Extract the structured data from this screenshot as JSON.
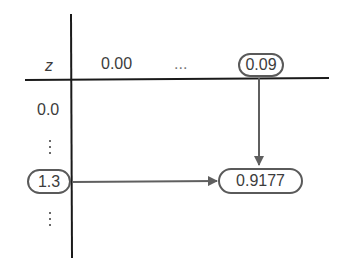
{
  "diagram": {
    "colors": {
      "axis": "#1a1a1a",
      "arrow": "#5f5f5f",
      "pill_border": "#5a5a5a",
      "text": "#3c3c3c"
    },
    "header": {
      "row_label": "z",
      "columns": [
        "0.00",
        "...",
        "0.09"
      ],
      "highlighted_column": "0.09"
    },
    "rows": {
      "first": "0.0",
      "ellipsis_upper": "⋮",
      "highlighted_row": "1.3",
      "ellipsis_lower": "⋮"
    },
    "result": {
      "value": "0.9177"
    },
    "arrows": [
      {
        "from": "column 0.09",
        "to": "cell 0.9177",
        "direction": "down"
      },
      {
        "from": "row 1.3",
        "to": "cell 0.9177",
        "direction": "right"
      }
    ]
  }
}
